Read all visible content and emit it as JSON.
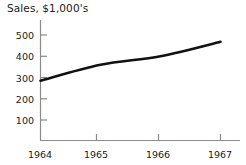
{
  "chart_data": {
    "type": "line",
    "title": "Sales, $1,000's",
    "xlabel": "",
    "ylabel": "",
    "grid": false,
    "legend": false,
    "x": [
      "1964",
      "1965",
      "1966",
      "1967"
    ],
    "categories": [
      "1964",
      "1965",
      "1966",
      "1967"
    ],
    "values": [
      285,
      360,
      400,
      468
    ],
    "series": [
      {
        "name": "Sales",
        "values": [
          285,
          360,
          400,
          468
        ],
        "color": "#111111"
      }
    ],
    "xtick_labels": [
      "1964",
      "1965",
      "1966",
      "1967"
    ],
    "ytick_labels": [
      "100",
      "200",
      "300",
      "400",
      "500"
    ],
    "ytick_values": [
      100,
      200,
      300,
      400,
      500
    ],
    "ylim": [
      0,
      550
    ],
    "xlim": [
      "1964",
      "1967"
    ],
    "axis_color": "#888888",
    "text_color": "#1a1a1a",
    "background": "#ffffff"
  }
}
